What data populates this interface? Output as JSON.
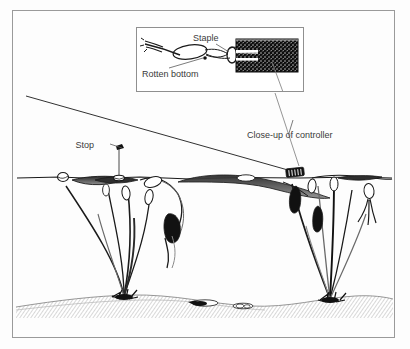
{
  "figure": {
    "background_color": "#fdfdfd",
    "frame_color": "#9a9a9a",
    "ink_color": "#1a1a1a",
    "label_color": "#3a3a3a",
    "water_color": "#ffffff",
    "bed_color": "#c9c9c9"
  },
  "labels": {
    "staple": "Staple",
    "rotten_bottom": "Rotten bottom",
    "stop": "Stop",
    "closeup": "Close-up of controller"
  },
  "inset": {
    "name": "close-up-of-controller-inset",
    "x": 136,
    "y": 27,
    "width": 168,
    "height": 65,
    "border_color": "#8f8f8f"
  },
  "scene": {
    "water_surface_y": 178,
    "bed_top_y": 300,
    "fishing_line": {
      "from_x": 26,
      "from_y": 96,
      "to_x": 295,
      "to_y": 172
    },
    "stop_knot": {
      "x": 120,
      "y": 148
    },
    "controller": {
      "x": 293,
      "y": 172,
      "width": 17,
      "height": 8
    },
    "dropper": {
      "x": 119,
      "from_y": 150,
      "to_y": 177
    },
    "plant_clusters": [
      {
        "name": "left-lily-cluster",
        "root_x": 124,
        "root_y": 297
      },
      {
        "name": "right-lily-cluster",
        "root_x": 330,
        "root_y": 300
      }
    ],
    "bed_debris_count": 3
  }
}
